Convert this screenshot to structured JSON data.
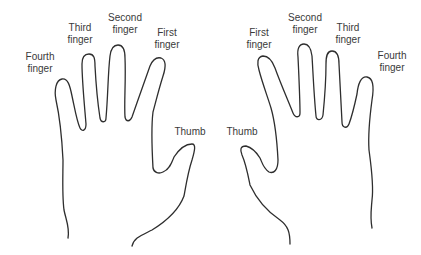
{
  "figure": {
    "left_hand": {
      "labels": {
        "fourth_finger": [
          "Fourth",
          "finger"
        ],
        "third_finger": [
          "Third",
          "finger"
        ],
        "second_finger": [
          "Second",
          "finger"
        ],
        "first_finger": [
          "First",
          "finger"
        ],
        "thumb": "Thumb"
      }
    },
    "right_hand": {
      "labels": {
        "first_finger": [
          "First",
          "finger"
        ],
        "second_finger": [
          "Second",
          "finger"
        ],
        "third_finger": [
          "Third",
          "finger"
        ],
        "fourth_finger": [
          "Fourth",
          "finger"
        ],
        "thumb": "Thumb"
      }
    },
    "line_color": "#2e2e2e",
    "text_color": "#3a3a3a",
    "background": "#ffffff"
  }
}
